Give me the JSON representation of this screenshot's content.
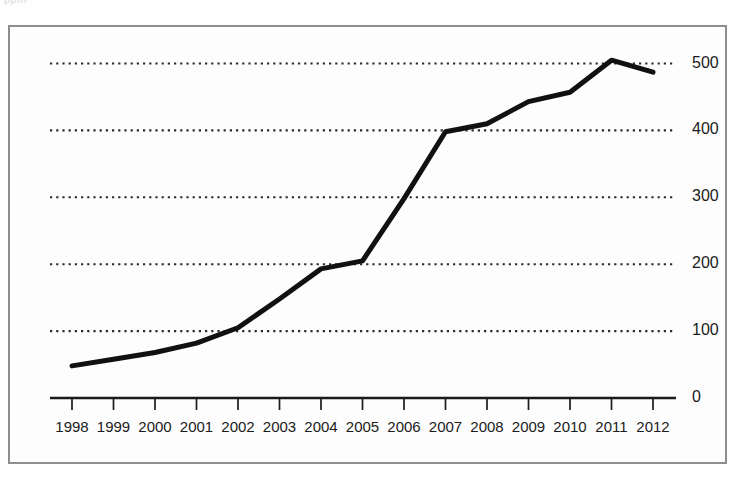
{
  "page": {
    "cut_off_top_text": "ppm",
    "frame_border_color": "#8e8e8e",
    "background_color": "#fdfdfd"
  },
  "chart_data": {
    "type": "line",
    "title": "",
    "subtitle": "",
    "xlabel": "",
    "ylabel": "",
    "categories": [
      "1998",
      "1999",
      "2000",
      "2001",
      "2002",
      "2003",
      "2004",
      "2005",
      "2006",
      "2007",
      "2008",
      "2009",
      "2010",
      "2011",
      "2012"
    ],
    "x": [
      1998,
      1999,
      2000,
      2001,
      2002,
      2003,
      2004,
      2005,
      2006,
      2007,
      2008,
      2009,
      2010,
      2011,
      2012
    ],
    "values": [
      48,
      58,
      68,
      82,
      105,
      148,
      193,
      205,
      298,
      398,
      410,
      443,
      457,
      505,
      487
    ],
    "series": [
      {
        "name": "",
        "values": [
          48,
          58,
          68,
          82,
          105,
          148,
          193,
          205,
          298,
          398,
          410,
          443,
          457,
          505,
          487
        ],
        "color": "#111111",
        "line_width": 5,
        "marker": "none"
      }
    ],
    "ylim": [
      0,
      560
    ],
    "xlim": [
      1997.4,
      2012.6
    ],
    "yticks": [
      0,
      100,
      200,
      300,
      400,
      500
    ],
    "ytick_labels": [
      "0",
      "100",
      "200",
      "300",
      "400",
      "500"
    ],
    "xtick_labels": [
      "1998",
      "1999",
      "2000",
      "2001",
      "2002",
      "2003",
      "2004",
      "2005",
      "2006",
      "2007",
      "2008",
      "2009",
      "2010",
      "2011",
      "2012"
    ],
    "grid": true,
    "grid_style": "dotted",
    "grid_axis": "y",
    "grid_color": "#2b2b2b",
    "axis_line_color": "#1b1b1b",
    "legend": false,
    "legend_position": "none",
    "annotations": [],
    "ytick_label_position": "right",
    "peak": {
      "x": "2011",
      "value": 505
    },
    "final": {
      "x": "2012",
      "value": 487
    },
    "start": {
      "x": "1998",
      "value": 48
    }
  }
}
